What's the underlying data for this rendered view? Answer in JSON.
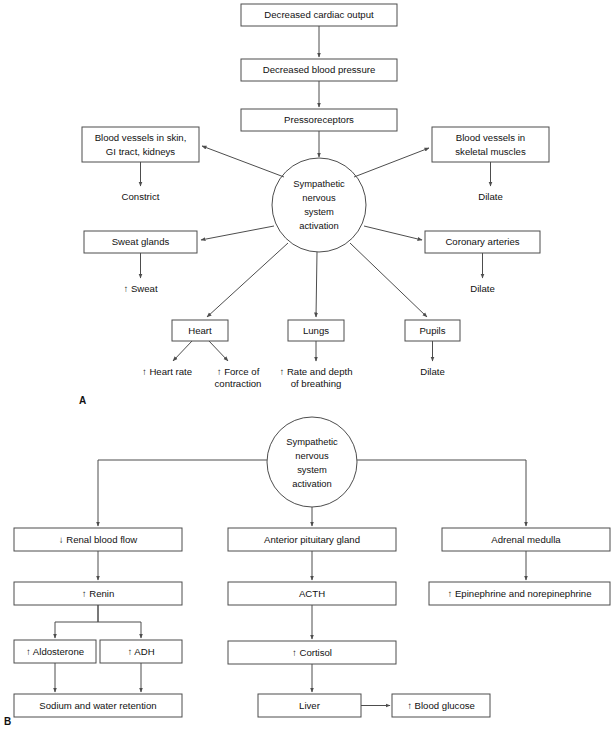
{
  "figure": {
    "panels": [
      {
        "id": "A",
        "letter": "A"
      },
      {
        "id": "B",
        "letter": "B"
      }
    ],
    "colors": {
      "stroke": "#4d4d4d",
      "text": "#111111",
      "background": "#ffffff"
    }
  },
  "panelA": {
    "letter": "A",
    "chain": {
      "cardiac_output": "Decreased cardiac output",
      "blood_pressure": "Decreased blood pressure",
      "pressoreceptors": "Pressoreceptors"
    },
    "hub": {
      "line1": "Sympathetic",
      "line2": "nervous",
      "line3": "system",
      "line4": "activation"
    },
    "branches": {
      "vessels_skin": {
        "line1": "Blood vessels in skin,",
        "line2": "GI tract, kidneys",
        "effect": "Constrict"
      },
      "vessels_muscle": {
        "line1": "Blood vessels in",
        "line2": "skeletal muscles",
        "effect": "Dilate"
      },
      "sweat_glands": {
        "label": "Sweat glands",
        "effect": "↑ Sweat"
      },
      "coronary_arteries": {
        "label": "Coronary arteries",
        "effect": "Dilate"
      },
      "heart": {
        "label": "Heart",
        "effect_left": "↑ Heart rate",
        "effect_right_line1": "↑ Force of",
        "effect_right_line2": "contraction"
      },
      "lungs": {
        "label": "Lungs",
        "effect_line1": "↑ Rate and depth",
        "effect_line2": "of breathing"
      },
      "pupils": {
        "label": "Pupils",
        "effect": "Dilate"
      }
    }
  },
  "panelB": {
    "letter": "B",
    "hub": {
      "line1": "Sympathetic",
      "line2": "nervous",
      "line3": "system",
      "line4": "activation"
    },
    "renal_column": {
      "renal_blood_flow": "↓ Renal blood flow",
      "renin": "↑ Renin",
      "aldosterone": "↑ Aldosterone",
      "adh": "↑ ADH",
      "retention": "Sodium and water retention"
    },
    "pituitary_column": {
      "pituitary": "Anterior pituitary gland",
      "acth": "ACTH",
      "cortisol": "↑ Cortisol",
      "liver": "Liver",
      "blood_glucose": "↑ Blood glucose"
    },
    "adrenal_column": {
      "adrenal_medulla": "Adrenal medulla",
      "catecholamines": "↑ Epinephrine and norepinephrine"
    }
  }
}
